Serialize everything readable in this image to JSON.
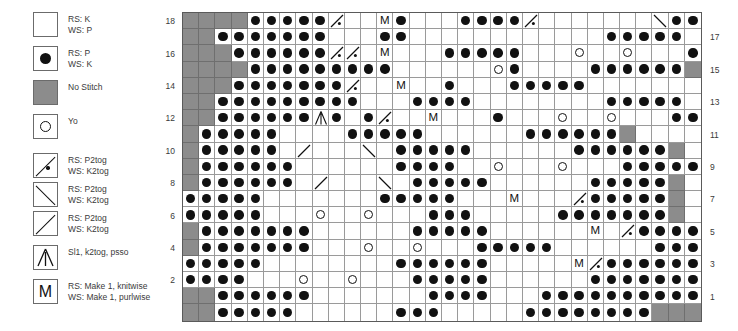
{
  "legend": {
    "title": "Stitch Key",
    "items": [
      {
        "symbol": "empty",
        "lines": [
          "RS: K",
          "WS: P"
        ]
      },
      {
        "symbol": "dot",
        "lines": [
          "RS: P",
          "WS: K"
        ]
      },
      {
        "symbol": "nostitch",
        "lines": [
          "No Stitch"
        ]
      },
      {
        "symbol": "yo",
        "lines": [
          "Yo"
        ]
      },
      {
        "symbol": "p2tog-up-dot",
        "lines": [
          "RS: P2tog",
          "WS: K2tog"
        ]
      },
      {
        "symbol": "p2tog-down",
        "lines": [
          "RS: P2tog",
          "WS: K2tog"
        ]
      },
      {
        "symbol": "p2tog-up",
        "lines": [
          "RS: P2tog",
          "WS: K2tog"
        ]
      },
      {
        "symbol": "psso",
        "lines": [
          "Sl1, k2tog, psso"
        ]
      },
      {
        "symbol": "make1",
        "lines": [
          "RS: Make 1, knitwise",
          "WS: Make 1, purlwise"
        ]
      }
    ]
  },
  "chart_data": {
    "type": "grid",
    "columns": 32,
    "rows": 19,
    "row_labels_left": [
      18,
      null,
      16,
      null,
      14,
      null,
      12,
      null,
      10,
      null,
      8,
      null,
      6,
      null,
      4,
      null,
      2,
      null,
      null
    ],
    "row_labels_right": [
      null,
      17,
      null,
      15,
      null,
      13,
      null,
      11,
      null,
      9,
      null,
      7,
      null,
      5,
      null,
      3,
      null,
      1,
      null
    ],
    "symbol_legend_map": {
      "e": "empty",
      "d": "purl-dot",
      "g": "no-stitch",
      "o": "yo",
      "u": "p2tog-up-dot",
      "n": "p2tog-down",
      "p": "p2tog-up",
      "s": "sl1-k2tog-psso",
      "M": "make-1"
    },
    "grid": [
      "ggggdddddu eMd eeddddu eeeeeendddddg",
      "ggddddddd eedd eeeeeeeeeeeddddd dg",
      "gggdddddduueM eeddddd eeoeeo eedddddd",
      "ggggddddddddd eeeeeod eeeddddddg",
      "gggdddddddu eM ed eeddddd eeeeeeeddddddg",
      "ggddddddddd eedddd eeeeeeeddddd eg",
      "ggddddddsd du eM eed eeoeeo eeddddddeg",
      "gddddd eeeddddd eeeeeddddddg",
      "gddddd p eeneddddd eeeeeddddddg",
      "gdddddd eeeeedddd eoeeeo eeddddde",
      "gdddddd p eeneddddd eeeeedddddg",
      "ddddd eeeeeeddddd eeMe eudddddg",
      "ddddd eeoeeo eeddd eeeedddddddg",
      "gddddddd eeeeeddddd eeeeeMeudddddg",
      "gddddddd eeoeeo eeddddd eeeeeddddddg",
      "ddddd eeeeeeedddddd eeeeMudddddddg",
      "dddd eeoeeo eeddddd eeeeeddddddddg",
      "ggdddddd eeeeeedddd eeddddddddddgg",
      "ggddddd eeeeeddd eeeeddddddddgggg"
    ]
  }
}
